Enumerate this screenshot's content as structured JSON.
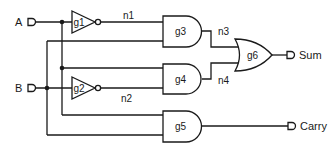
{
  "diagram": {
    "type": "half-adder logic circuit",
    "inputs": [
      {
        "id": "A",
        "label": "A"
      },
      {
        "id": "B",
        "label": "B"
      }
    ],
    "outputs": [
      {
        "id": "Sum",
        "label": "Sum"
      },
      {
        "id": "Carry",
        "label": "Carry"
      }
    ],
    "gates": [
      {
        "id": "g1",
        "label": "g1",
        "type": "NOT",
        "inputs": [
          "A"
        ],
        "output": "n1"
      },
      {
        "id": "g2",
        "label": "g2",
        "type": "NOT",
        "inputs": [
          "B"
        ],
        "output": "n2"
      },
      {
        "id": "g3",
        "label": "g3",
        "type": "AND",
        "inputs": [
          "n1",
          "B"
        ],
        "output": "n3"
      },
      {
        "id": "g4",
        "label": "g4",
        "type": "AND",
        "inputs": [
          "A",
          "n2"
        ],
        "output": "n4"
      },
      {
        "id": "g5",
        "label": "g5",
        "type": "AND",
        "inputs": [
          "A",
          "B"
        ],
        "output": "Carry"
      },
      {
        "id": "g6",
        "label": "g6",
        "type": "OR",
        "inputs": [
          "n3",
          "n4"
        ],
        "output": "Sum"
      }
    ],
    "nets": [
      {
        "id": "n1",
        "label": "n1"
      },
      {
        "id": "n2",
        "label": "n2"
      },
      {
        "id": "n3",
        "label": "n3"
      },
      {
        "id": "n4",
        "label": "n4"
      }
    ]
  }
}
